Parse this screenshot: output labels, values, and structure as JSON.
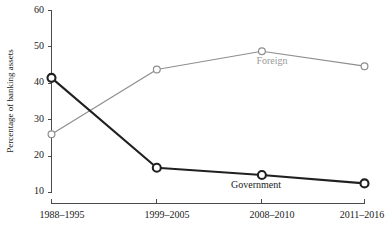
{
  "chart_data": {
    "type": "line",
    "title": "",
    "xlabel": "",
    "ylabel": "Percentage of banking assets",
    "categories": [
      "1988–1995",
      "1999–2005",
      "2008–2010",
      "2011–2016"
    ],
    "ylim": [
      10,
      60
    ],
    "yticks": [
      10,
      20,
      30,
      40,
      50,
      60
    ],
    "ytick_labels": [
      "10",
      "20",
      "30",
      "40",
      "50",
      "60"
    ],
    "grid": false,
    "legend": "inline-labels",
    "series": [
      {
        "name": "Government",
        "color": "#202020",
        "marker": "circle-open",
        "values": [
          41.5,
          16.8,
          14.8,
          12.5
        ],
        "label_text": "Government",
        "label_x_index": 2,
        "label_offset_y": 13
      },
      {
        "name": "Foreign",
        "color": "#8e8e8e",
        "marker": "circle-open",
        "values": [
          26.0,
          43.8,
          48.8,
          44.7
        ],
        "label_text": "Foreign",
        "label_x_index": 2,
        "label_offset_y": 13
      }
    ]
  },
  "axes": {
    "y_axis_title": "Percentage of banking assets",
    "y_tick_0": "10",
    "y_tick_1": "20",
    "y_tick_2": "30",
    "y_tick_3": "40",
    "y_tick_4": "50",
    "y_tick_5": "60",
    "x_tick_0": "1988–1995",
    "x_tick_1": "1999–2005",
    "x_tick_2": "2008–2010",
    "x_tick_3": "2011–2016"
  },
  "series_labels": {
    "foreign": "Foreign",
    "government": "Government"
  },
  "colors": {
    "government_line": "#202020",
    "foreign_line": "#8e8e8e",
    "axis": "#4a4a4a",
    "text": "#1a1a1a",
    "background": "#ffffff"
  }
}
